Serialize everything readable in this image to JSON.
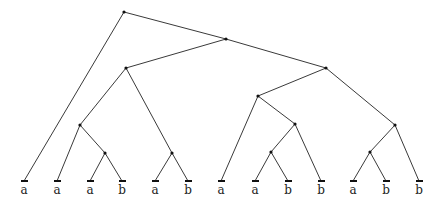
{
  "diagram": {
    "type": "binary-tree",
    "nodes": [
      {
        "id": "root",
        "x": 124,
        "y": 12
      },
      {
        "id": "n1",
        "x": 226,
        "y": 39
      },
      {
        "id": "n2",
        "x": 126,
        "y": 68
      },
      {
        "id": "n3",
        "x": 326,
        "y": 68
      },
      {
        "id": "n4",
        "x": 80,
        "y": 125
      },
      {
        "id": "n5",
        "x": 105,
        "y": 153
      },
      {
        "id": "n6",
        "x": 172,
        "y": 153
      },
      {
        "id": "n7",
        "x": 258,
        "y": 96
      },
      {
        "id": "n8",
        "x": 295,
        "y": 124
      },
      {
        "id": "n9",
        "x": 271,
        "y": 152
      },
      {
        "id": "n10",
        "x": 395,
        "y": 125
      },
      {
        "id": "n11",
        "x": 370,
        "y": 152
      }
    ],
    "leaves": [
      {
        "id": "l0",
        "x": 24,
        "label": "a"
      },
      {
        "id": "l1",
        "x": 57,
        "label": "a"
      },
      {
        "id": "l2",
        "x": 90,
        "label": "a"
      },
      {
        "id": "l3",
        "x": 122,
        "label": "b"
      },
      {
        "id": "l4",
        "x": 155,
        "label": "a"
      },
      {
        "id": "l5",
        "x": 188,
        "label": "b"
      },
      {
        "id": "l6",
        "x": 221,
        "label": "a"
      },
      {
        "id": "l7",
        "x": 255,
        "label": "a"
      },
      {
        "id": "l8",
        "x": 288,
        "label": "b"
      },
      {
        "id": "l9",
        "x": 321,
        "label": "b"
      },
      {
        "id": "l10",
        "x": 353,
        "label": "a"
      },
      {
        "id": "l11",
        "x": 386,
        "label": "b"
      },
      {
        "id": "l12",
        "x": 419,
        "label": "b"
      }
    ],
    "leaf_y": 181,
    "edges": [
      [
        "root",
        "l0"
      ],
      [
        "root",
        "n1"
      ],
      [
        "n1",
        "n2"
      ],
      [
        "n1",
        "n3"
      ],
      [
        "n2",
        "n4"
      ],
      [
        "n2",
        "n6"
      ],
      [
        "n4",
        "l1"
      ],
      [
        "n4",
        "n5"
      ],
      [
        "n5",
        "l2"
      ],
      [
        "n5",
        "l3"
      ],
      [
        "n6",
        "l4"
      ],
      [
        "n6",
        "l5"
      ],
      [
        "n3",
        "n7"
      ],
      [
        "n3",
        "n10"
      ],
      [
        "n7",
        "l6"
      ],
      [
        "n7",
        "n8"
      ],
      [
        "n8",
        "n9"
      ],
      [
        "n8",
        "l9"
      ],
      [
        "n9",
        "l7"
      ],
      [
        "n9",
        "l8"
      ],
      [
        "n10",
        "n11"
      ],
      [
        "n10",
        "l12"
      ],
      [
        "n11",
        "l10"
      ],
      [
        "n11",
        "l11"
      ]
    ]
  }
}
